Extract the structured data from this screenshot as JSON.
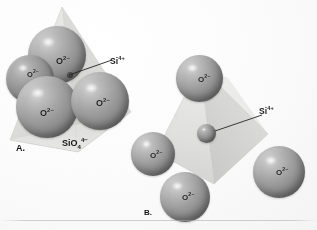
{
  "figure": {
    "background_color": "#fdfdfc",
    "sphere_color": "#8e8e8c",
    "tetrahedron_face_color": "#dcdcd8",
    "label_color": "#1c1c1a"
  },
  "panels": [
    {
      "letter": "A.",
      "caption_formula": "SiO",
      "caption_sub": "4",
      "caption_sup": "4−",
      "description": "Close-packed oxygen anions forming a tetrahedron"
    },
    {
      "letter": "B.",
      "description": "Expanded tetrahedron showing central silicon cation"
    }
  ],
  "labels": {
    "oxygen": "O",
    "oxygen_charge": "2−",
    "silicon": "Si",
    "silicon_charge": "4+"
  },
  "panel_a": {
    "oxygen_ions": [
      {
        "id": "o-back-top",
        "label": "O",
        "charge": "2−"
      },
      {
        "id": "o-left-rear",
        "label": "O",
        "charge": "2−"
      },
      {
        "id": "o-front-left",
        "label": "O",
        "charge": "2−"
      },
      {
        "id": "o-front-right",
        "label": "O",
        "charge": "2−"
      }
    ],
    "silicon_ion": {
      "id": "si-center-a",
      "label": "Si",
      "charge": "4+"
    }
  },
  "panel_b": {
    "oxygen_ions": [
      {
        "id": "o-apex",
        "label": "O",
        "charge": "2−"
      },
      {
        "id": "o-lower-left",
        "label": "O",
        "charge": "2−"
      },
      {
        "id": "o-bottom",
        "label": "O",
        "charge": "2−"
      },
      {
        "id": "o-right",
        "label": "O",
        "charge": "2−"
      }
    ],
    "silicon_ion": {
      "id": "si-center-b",
      "label": "Si",
      "charge": "4+"
    }
  },
  "caption_strip": {
    "text": ""
  }
}
